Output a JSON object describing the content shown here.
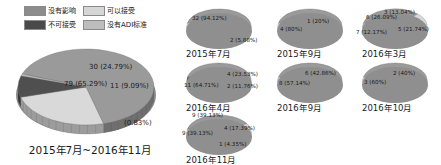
{
  "legend": {
    "items": [
      {
        "label": "没有影响",
        "color": "#8c8c8c"
      },
      {
        "label": "可以接受",
        "color": "#d6d6d6"
      },
      {
        "label": "不可接受",
        "color": "#4a4a4a"
      },
      {
        "label": "没有ADI标准",
        "color": "#bdbdbd"
      }
    ]
  },
  "chart_data": [
    {
      "type": "pie",
      "title": "2015年7月~2016年11月",
      "name": "main-pie",
      "categories": [
        "没有影响",
        "可以接受",
        "不可接受",
        "没有ADI标准"
      ],
      "values": [
        79,
        30,
        11,
        1
      ],
      "percents": [
        "65.29%",
        "24.79%",
        "9.09%",
        "0.83%"
      ],
      "labels": [
        "79 (65.29%)",
        "30 (24.79%)",
        "11 (9.09%)",
        "(0.83%)"
      ],
      "colors": [
        "#9a9a9a",
        "#d9d9d9",
        "#4f4f4f",
        "#bdbdbd"
      ]
    },
    {
      "type": "pie",
      "title": "2015年7月",
      "name": "pie-2015-07",
      "categories": [
        "没有影响",
        "可以接受"
      ],
      "values": [
        32,
        2
      ],
      "percents": [
        "94.12%",
        "5.88%"
      ],
      "labels": [
        "32 (94.12%)",
        "2 (5.88%)"
      ],
      "colors": [
        "#9a9a9a",
        "#d9d9d9"
      ]
    },
    {
      "type": "pie",
      "title": "2015年9月",
      "name": "pie-2015-09",
      "categories": [
        "没有影响",
        "可以接受"
      ],
      "values": [
        4,
        1
      ],
      "percents": [
        "80.00%",
        "20.00%"
      ],
      "labels": [
        "4 (80%)",
        "1 (20%)"
      ],
      "colors": [
        "#9a9a9a",
        "#d9d9d9"
      ]
    },
    {
      "type": "pie",
      "title": "2016年3月",
      "name": "pie-2016-03",
      "categories": [
        "没有影响",
        "可以接受",
        "不可接受",
        "没有ADI标准"
      ],
      "values": [
        8,
        5,
        7,
        3
      ],
      "percents": [
        "26.09%",
        "21.74%",
        "12.17%",
        "13.04%"
      ],
      "labels": [
        "6 (26.09%)",
        "5 (21.74%)",
        "7 (12.17%)",
        "3 (13.04%)"
      ],
      "colors": [
        "#9a9a9a",
        "#d9d9d9",
        "#4f4f4f",
        "#bdbdbd"
      ]
    },
    {
      "type": "pie",
      "title": "2016年4月",
      "name": "pie-2016-04",
      "categories": [
        "没有影响",
        "可以接受",
        "不可接受"
      ],
      "values": [
        11,
        4,
        2
      ],
      "percents": [
        "64.71%",
        "23.53%",
        "11.76%"
      ],
      "labels": [
        "11 (64.71%)",
        "4 (23.53%)",
        "2 (11.76%)"
      ],
      "colors": [
        "#9a9a9a",
        "#d9d9d9",
        "#4f4f4f"
      ]
    },
    {
      "type": "pie",
      "title": "2016年9月",
      "name": "pie-2016-09",
      "categories": [
        "没有影响",
        "可以接受"
      ],
      "values": [
        8,
        6
      ],
      "percents": [
        "57.14%",
        "42.86%"
      ],
      "labels": [
        "8 (57.14%)",
        "6 (42.86%)"
      ],
      "colors": [
        "#9a9a9a",
        "#d9d9d9"
      ]
    },
    {
      "type": "pie",
      "title": "2016年10月",
      "name": "pie-2016-10",
      "categories": [
        "没有影响",
        "可以接受"
      ],
      "values": [
        3,
        2
      ],
      "percents": [
        "60.00%",
        "40.00%"
      ],
      "labels": [
        "3 (60%)",
        "2 (40%)"
      ],
      "colors": [
        "#9a9a9a",
        "#d9d9d9"
      ]
    },
    {
      "type": "pie",
      "title": "2016年11月",
      "name": "pie-2016-11",
      "categories": [
        "没有影响",
        "可以接受",
        "不可接受",
        "没有ADI标准"
      ],
      "values": [
        9,
        9,
        4,
        1
      ],
      "percents": [
        "39.13%",
        "39.13%",
        "17.39%",
        "4.35%"
      ],
      "labels": [
        "9 (39.13%)",
        "9 (39.13%)",
        "4 (17.39%)",
        "1 (4.35%)"
      ],
      "colors": [
        "#9a9a9a",
        "#d9d9d9",
        "#4f4f4f",
        "#bdbdbd"
      ]
    }
  ]
}
